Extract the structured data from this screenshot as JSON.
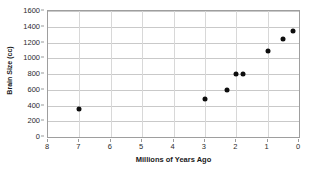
{
  "chart_data": {
    "type": "scatter",
    "title": "",
    "xlabel": "Millions of Years Ago",
    "ylabel": "Brain Size (cc)",
    "xlim": [
      8,
      0
    ],
    "ylim": [
      0,
      1600
    ],
    "x_reversed": true,
    "grid": true,
    "legend": "none",
    "marker_color": "#0d0d0d",
    "marker_shape": "circle",
    "xticks": [
      8,
      7,
      6,
      5,
      4,
      3,
      2,
      1,
      0
    ],
    "xticklabels": [
      "8",
      "7",
      "6",
      "5",
      "4",
      "3",
      "2",
      "1",
      "0"
    ],
    "yticks": [
      0,
      200,
      400,
      600,
      800,
      1000,
      1200,
      1400,
      1600
    ],
    "yticklabels": [
      "0",
      "200",
      "400",
      "600",
      "800",
      "1000",
      "1200",
      "1400",
      "1600"
    ],
    "x": [
      7.0,
      3.0,
      2.3,
      2.0,
      1.8,
      1.0,
      0.5,
      0.2
    ],
    "y": [
      350,
      480,
      600,
      795,
      795,
      1090,
      1240,
      1340
    ],
    "points": [
      {
        "x": 7.0,
        "y": 350
      },
      {
        "x": 3.0,
        "y": 480
      },
      {
        "x": 2.3,
        "y": 600
      },
      {
        "x": 2.0,
        "y": 795
      },
      {
        "x": 1.8,
        "y": 795
      },
      {
        "x": 1.0,
        "y": 1090
      },
      {
        "x": 0.5,
        "y": 1240
      },
      {
        "x": 0.2,
        "y": 1340
      }
    ]
  },
  "colors": {
    "marker": "#0d0d0d",
    "gridline": "#c9c9c9",
    "axis_border": "#9e9e9e",
    "tick_text": "#2b2b2b",
    "title_text": "#1a1a1a",
    "background": "#ffffff"
  }
}
